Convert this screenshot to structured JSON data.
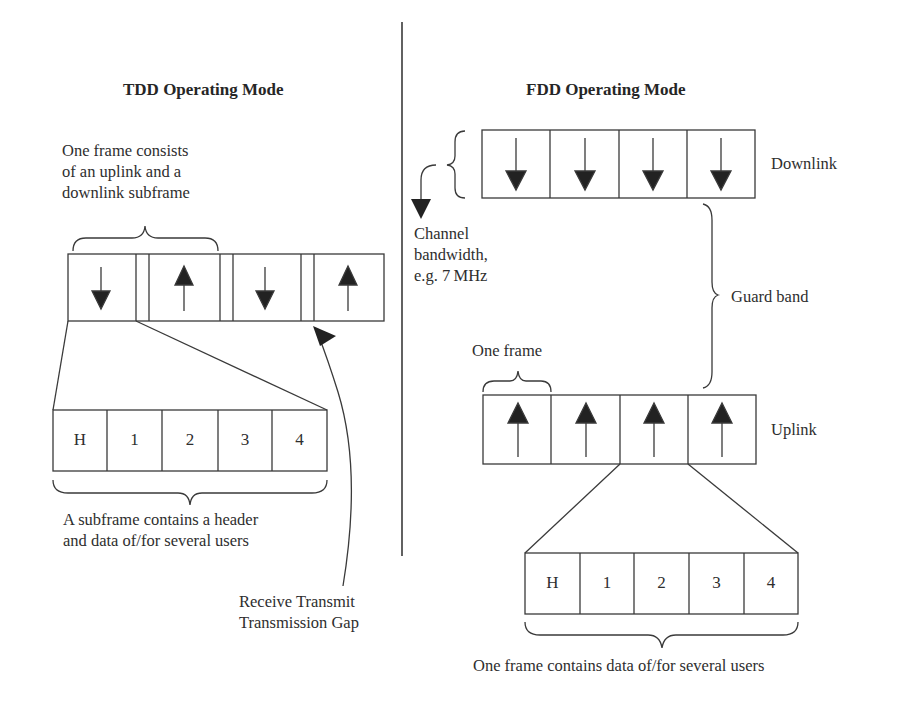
{
  "tdd": {
    "title": "TDD Operating Mode",
    "frame_note": [
      "One frame consists",
      "of an uplink and a",
      "downlink subframe"
    ],
    "subframes": [
      {
        "direction": "down"
      },
      {
        "direction": "up"
      },
      {
        "direction": "down"
      },
      {
        "direction": "up"
      }
    ],
    "subframe_cells": [
      "H",
      "1",
      "2",
      "3",
      "4"
    ],
    "subframe_note": [
      "A subframe contains a header",
      "and data of/for several users"
    ],
    "gap_note": [
      "Receive Transmit",
      "Transmission Gap"
    ]
  },
  "fdd": {
    "title": "FDD Operating Mode",
    "downlink_label": "Downlink",
    "uplink_label": "Uplink",
    "guard_band_label": "Guard band",
    "channel_note": [
      "Channel",
      "bandwidth,",
      "e.g. 7 MHz"
    ],
    "one_frame_label": "One frame",
    "downlink_frames": [
      {
        "direction": "down"
      },
      {
        "direction": "down"
      },
      {
        "direction": "down"
      },
      {
        "direction": "down"
      }
    ],
    "uplink_frames": [
      {
        "direction": "up"
      },
      {
        "direction": "up"
      },
      {
        "direction": "up"
      },
      {
        "direction": "up"
      }
    ],
    "frame_cells": [
      "H",
      "1",
      "2",
      "3",
      "4"
    ],
    "frame_note": "One frame contains data of/for several users"
  },
  "colors": {
    "line": "#3a3a3a",
    "arrow_fill": "#222222",
    "text": "#2e2e2e"
  }
}
